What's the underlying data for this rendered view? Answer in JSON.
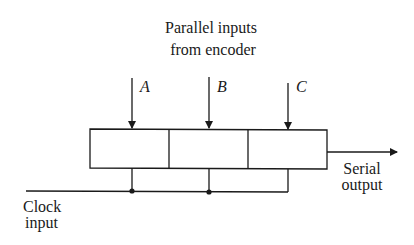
{
  "diagram": {
    "title_line1": "Parallel inputs",
    "title_line2": "from encoder",
    "inputs": [
      {
        "label": "A"
      },
      {
        "label": "B"
      },
      {
        "label": "C"
      }
    ],
    "output_line1": "Serial",
    "output_line2": "output",
    "clock_line1": "Clock",
    "clock_line2": "input",
    "register_cells": 3,
    "colors": {
      "line": "#1a1a1a",
      "background": "#ffffff"
    }
  }
}
